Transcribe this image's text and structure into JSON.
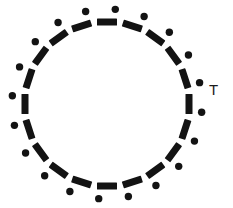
{
  "figure": {
    "title": "",
    "background_color": "#ffffff",
    "width": 233,
    "height": 208
  },
  "chart_data": {
    "type": "scatter",
    "title": "",
    "subtitle": "",
    "xlabel": "",
    "ylabel": "",
    "grid": false,
    "legend_position": "none",
    "geometry": {
      "center_x": 107,
      "center_y": 104,
      "dash_radius": 82,
      "dot_radius": 95,
      "dash_length": 20,
      "dash_thickness": 7,
      "dot_diameter": 7.4,
      "element_count": 20,
      "angle_step_degrees": 18,
      "angle_start_degrees": -90,
      "dash_orientation": "tangential",
      "dot_offset_degrees": 5
    },
    "colors": {
      "mark": "#131313",
      "dot": "#131313",
      "background": "#ffffff",
      "label": "#1b1b1b"
    },
    "series": [
      {
        "name": "dashes",
        "count": 20,
        "angles_degrees": [
          -90,
          -72,
          -54,
          -36,
          -18,
          0,
          18,
          36,
          54,
          72,
          90,
          108,
          126,
          144,
          162,
          180,
          198,
          216,
          234,
          252
        ]
      },
      {
        "name": "dots",
        "count": 20,
        "angles_degrees": [
          -85,
          -67,
          -49,
          -31,
          -13,
          5,
          23,
          41,
          59,
          77,
          95,
          113,
          131,
          149,
          167,
          185,
          203,
          221,
          239,
          257
        ]
      }
    ]
  },
  "annotations": [
    {
      "text": "T",
      "x": 209,
      "y": 91,
      "font_size": 15
    }
  ]
}
